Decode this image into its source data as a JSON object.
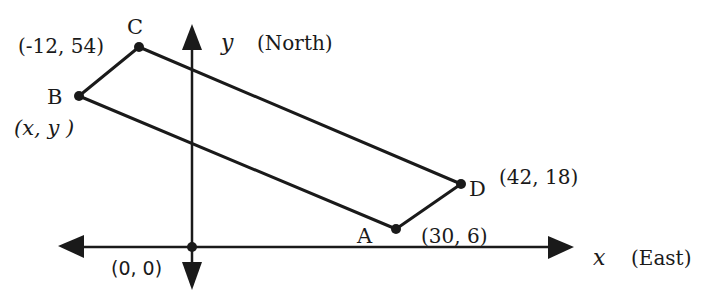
{
  "diagram": {
    "type": "coordinate-parallelogram",
    "axes": {
      "x_label": "x",
      "x_direction": "(East)",
      "y_label": "y",
      "y_direction": "(North)",
      "origin_label": "(0, 0)"
    },
    "points": [
      {
        "name": "A",
        "coords": "(30, 6)",
        "x": 30,
        "y": 6
      },
      {
        "name": "B",
        "coords": "(x, y )",
        "x": null,
        "y": null
      },
      {
        "name": "C",
        "coords": "(-12, 54)",
        "x": -12,
        "y": 54
      },
      {
        "name": "D",
        "coords": "(42, 18)",
        "x": 42,
        "y": 18
      }
    ],
    "edges": [
      [
        "A",
        "B"
      ],
      [
        "B",
        "C"
      ],
      [
        "C",
        "D"
      ],
      [
        "D",
        "A"
      ]
    ],
    "colors": {
      "ink": "#1a1a1a",
      "background": "#ffffff"
    }
  }
}
